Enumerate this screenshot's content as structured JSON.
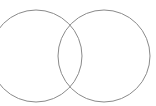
{
  "diagram": {
    "type": "venn",
    "stroke_color": "#8a8a8a",
    "background": "#ffffff",
    "circles": [
      {
        "name": "left-circle",
        "cx": 36,
        "cy": 56,
        "r": 46
      },
      {
        "name": "right-circle",
        "cx": 104,
        "cy": 56,
        "r": 46
      }
    ]
  }
}
